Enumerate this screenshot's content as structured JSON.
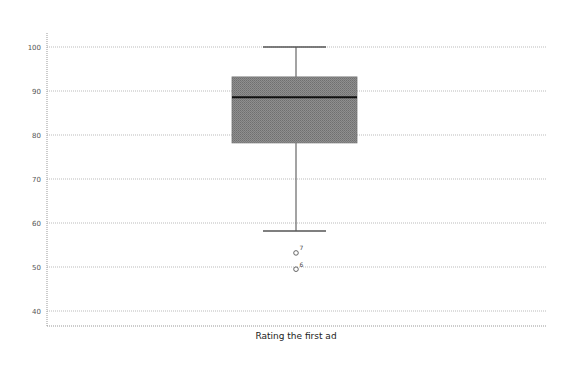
{
  "chart_data": {
    "type": "box",
    "title": "",
    "xlabel": "Rating the first ad",
    "ylabel": "",
    "categories": [
      "Rating the first ad"
    ],
    "ylim": [
      37,
      103
    ],
    "yticks": [
      40,
      50,
      60,
      70,
      80,
      90,
      100
    ],
    "grid": true,
    "legend": null,
    "series": [
      {
        "name": "Rating the first ad",
        "min": 58.2,
        "q1": 78.2,
        "median": 88.6,
        "q3": 93.2,
        "max": 100,
        "outliers": [
          {
            "label": "7",
            "value": 53.2
          },
          {
            "label": "6",
            "value": 49.5
          }
        ]
      }
    ],
    "colors": {
      "box_fill": "#8a8a8a",
      "median_line": "#111111",
      "whisker": "#666666",
      "grid": "#bbbbbb",
      "axis": "#888888"
    }
  }
}
